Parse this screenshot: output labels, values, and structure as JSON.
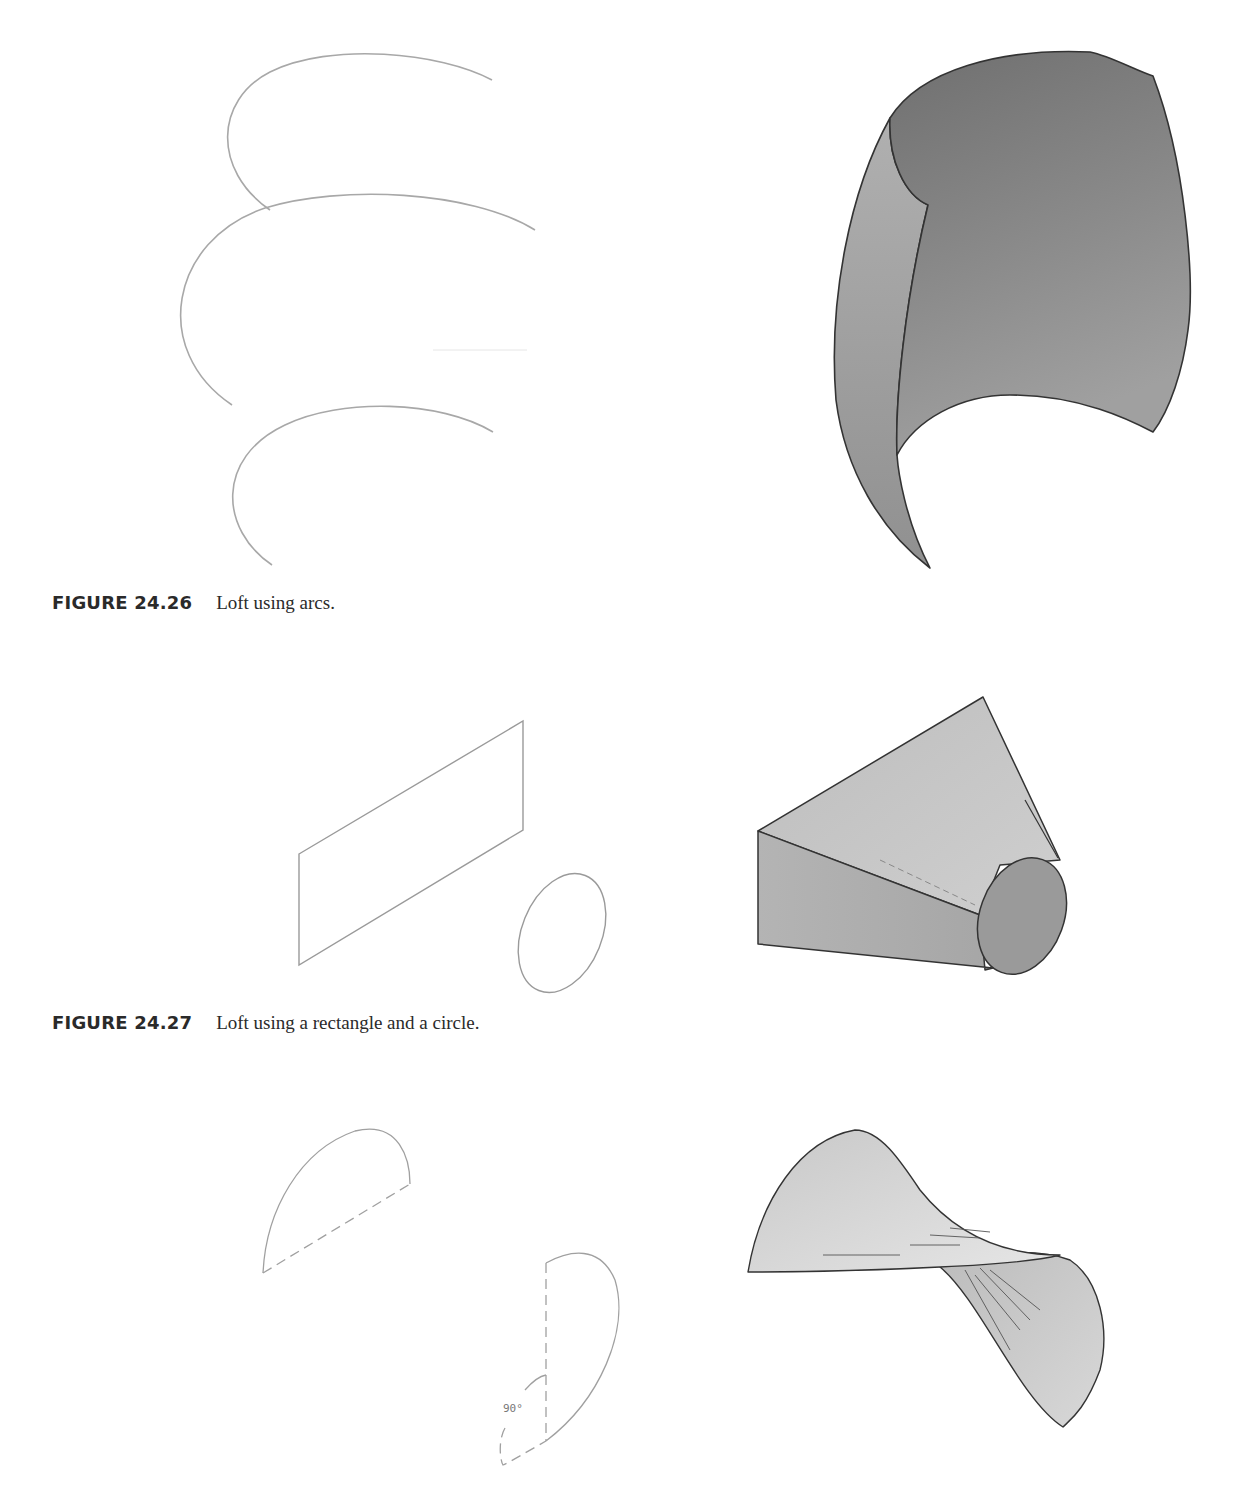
{
  "figures": [
    {
      "number": "FIGURE 24.26",
      "caption": "Loft using arcs.",
      "left_panel": "three-arc-profiles",
      "right_panel": "lofted-arc-surface"
    },
    {
      "number": "FIGURE 24.27",
      "caption": "Loft using a rectangle and a circle.",
      "left_panel": "rectangle-and-circle-profiles",
      "right_panel": "lofted-rectangle-to-circle-solid"
    },
    {
      "number": "",
      "caption": "",
      "left_panel": "two-half-ellipse-profiles-rotated",
      "right_panel": "lofted-twisted-surface",
      "annotation": "90°"
    }
  ],
  "colors": {
    "profile_line": "#a8a8a8",
    "surface_dark": "#7d7d7d",
    "surface_mid": "#9a9a9a",
    "surface_light": "#c4c4c4",
    "edge": "#333333"
  }
}
